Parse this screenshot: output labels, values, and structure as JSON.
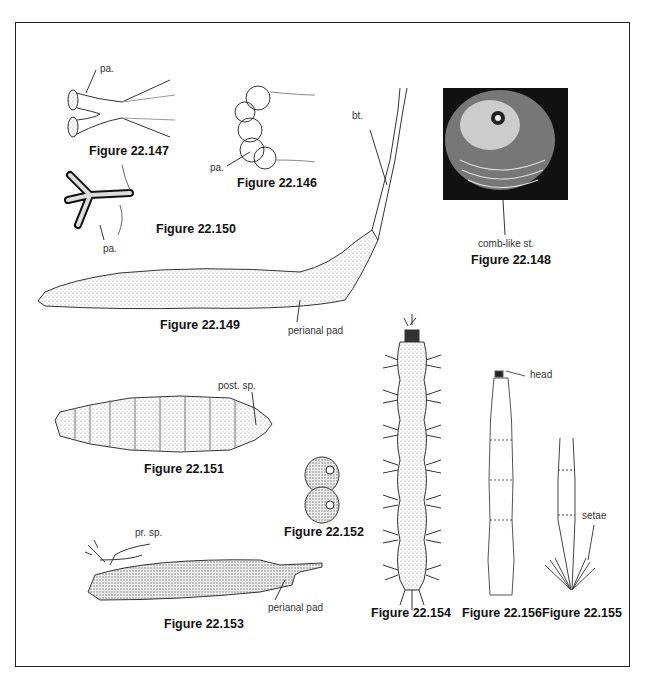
{
  "plate": {
    "figures": [
      {
        "id": "fig-22-147",
        "caption": "Figure 22.147",
        "labels": [
          "pa."
        ]
      },
      {
        "id": "fig-22-146",
        "caption": "Figure 22.146",
        "labels": [
          "pa."
        ]
      },
      {
        "id": "fig-22-150",
        "caption": "Figure 22.150",
        "labels": [
          "pa."
        ]
      },
      {
        "id": "fig-22-148",
        "caption": "Figure 22.148",
        "labels": [
          "comb-like st."
        ]
      },
      {
        "id": "fig-22-149",
        "caption": "Figure 22.149",
        "labels": [
          "bt.",
          "perianal pad"
        ]
      },
      {
        "id": "fig-22-151",
        "caption": "Figure 22.151",
        "labels": [
          "post. sp."
        ]
      },
      {
        "id": "fig-22-152",
        "caption": "Figure 22.152",
        "labels": []
      },
      {
        "id": "fig-22-153",
        "caption": "Figure 22.153",
        "labels": [
          "pr. sp.",
          "perianal pad"
        ]
      },
      {
        "id": "fig-22-154",
        "caption": "Figure 22.154",
        "labels": []
      },
      {
        "id": "fig-22-156",
        "caption": "Figure 22.156",
        "labels": [
          "head"
        ]
      },
      {
        "id": "fig-22-155",
        "caption": "Figure 22.155",
        "labels": [
          "setae"
        ]
      }
    ]
  }
}
